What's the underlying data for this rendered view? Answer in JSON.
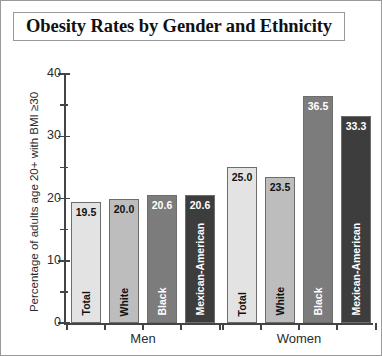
{
  "title": "Obesity Rates by Gender and Ethnicity",
  "axis": {
    "ylabel": "Percentage of adults age 20+ with BMI ≥30",
    "yticks": [
      "0",
      "10",
      "20",
      "30",
      "40"
    ],
    "yticks_minor": [
      "5",
      "15",
      "25",
      "35"
    ]
  },
  "groups": [
    {
      "label": "Men"
    },
    {
      "label": "Women"
    }
  ],
  "colors": {
    "total": "#e3e3e3",
    "white": "#bdbdbd",
    "black": "#7c7c7c",
    "mexican_american": "#3d3d3d",
    "axis": "#444444",
    "frame": "#9a9a9a",
    "text": "#2b2b2b"
  },
  "chart_data": {
    "type": "bar",
    "title": "Obesity Rates by Gender and Ethnicity",
    "xlabel": "",
    "ylabel": "Percentage of adults age 20+ with BMI ≥30",
    "ylim": [
      0,
      40
    ],
    "ytick_interval": 10,
    "yminor_tick_interval": 5,
    "grid": false,
    "legend": "none",
    "group_labels": [
      "Men",
      "Women"
    ],
    "categories": [
      "Total",
      "White",
      "Black",
      "Mexican-American"
    ],
    "series": [
      {
        "name": "Men",
        "values": [
          19.5,
          20.0,
          20.6,
          20.6
        ]
      },
      {
        "name": "Women",
        "values": [
          25.0,
          23.5,
          36.5,
          33.3
        ]
      }
    ],
    "bars": [
      {
        "group": "Men",
        "category": "Total",
        "value": 19.5,
        "label": "19.5",
        "color": "#e3e3e3",
        "value_text_color": "#111111",
        "cat_text_color": "#111111"
      },
      {
        "group": "Men",
        "category": "White",
        "value": 20.0,
        "label": "20.0",
        "color": "#bdbdbd",
        "value_text_color": "#111111",
        "cat_text_color": "#111111"
      },
      {
        "group": "Men",
        "category": "Black",
        "value": 20.6,
        "label": "20.6",
        "color": "#7c7c7c",
        "value_text_color": "#ffffff",
        "cat_text_color": "#ffffff"
      },
      {
        "group": "Men",
        "category": "Mexican-American",
        "value": 20.6,
        "label": "20.6",
        "color": "#3d3d3d",
        "value_text_color": "#ffffff",
        "cat_text_color": "#ffffff"
      },
      {
        "group": "Women",
        "category": "Total",
        "value": 25.0,
        "label": "25.0",
        "color": "#e3e3e3",
        "value_text_color": "#111111",
        "cat_text_color": "#111111"
      },
      {
        "group": "Women",
        "category": "White",
        "value": 23.5,
        "label": "23.5",
        "color": "#bdbdbd",
        "value_text_color": "#111111",
        "cat_text_color": "#111111"
      },
      {
        "group": "Women",
        "category": "Black",
        "value": 36.5,
        "label": "36.5",
        "color": "#7c7c7c",
        "value_text_color": "#ffffff",
        "cat_text_color": "#ffffff"
      },
      {
        "group": "Women",
        "category": "Mexican-American",
        "value": 33.3,
        "label": "33.3",
        "color": "#3d3d3d",
        "value_text_color": "#ffffff",
        "cat_text_color": "#ffffff"
      }
    ]
  }
}
